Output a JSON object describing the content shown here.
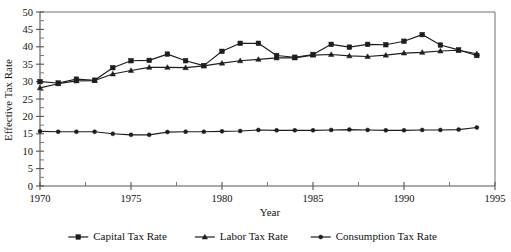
{
  "chart_data": {
    "type": "line",
    "title": "",
    "xlabel": "Year",
    "ylabel": "Effective Tax Rate",
    "xlim": [
      1970,
      1995
    ],
    "ylim": [
      0,
      50
    ],
    "ytick_step": 5,
    "xtick_step": 5,
    "x_minor_step": 2.5,
    "grid": false,
    "legend_position": "bottom",
    "x": [
      1970,
      1971,
      1972,
      1973,
      1974,
      1975,
      1976,
      1977,
      1978,
      1979,
      1980,
      1981,
      1982,
      1983,
      1984,
      1985,
      1986,
      1987,
      1988,
      1989,
      1990,
      1991,
      1992,
      1993,
      1994
    ],
    "xticklabels": [
      "1970",
      "1975",
      "1980",
      "1985",
      "1990",
      "1995"
    ],
    "xtickvalues": [
      1970,
      1975,
      1980,
      1985,
      1990,
      1995
    ],
    "yticklabels": [
      "0",
      "5",
      "10",
      "15",
      "20",
      "25",
      "30",
      "35",
      "40",
      "45",
      "50"
    ],
    "ytickvalues": [
      0,
      5,
      10,
      15,
      20,
      25,
      30,
      35,
      40,
      45,
      50
    ],
    "series": [
      {
        "name": "Capital Tax Rate",
        "marker": "square",
        "color": "#1d1d1d",
        "values": [
          30.0,
          29.6,
          30.7,
          30.4,
          34.0,
          36.0,
          36.1,
          37.9,
          36.0,
          34.6,
          38.7,
          41.0,
          41.0,
          37.5,
          37.0,
          37.8,
          40.7,
          39.9,
          40.7,
          40.6,
          41.6,
          43.5,
          40.5,
          39.1,
          37.5
        ]
      },
      {
        "name": "Labor Tax Rate",
        "marker": "triangle",
        "color": "#1d1d1d",
        "values": [
          28.2,
          29.4,
          30.2,
          30.3,
          32.2,
          33.2,
          34.1,
          34.1,
          34.0,
          34.5,
          35.3,
          36.0,
          36.4,
          36.8,
          36.8,
          37.6,
          37.8,
          37.4,
          37.2,
          37.6,
          38.2,
          38.4,
          38.8,
          39.0,
          38.0
        ]
      },
      {
        "name": "Consumption Tax Rate",
        "marker": "circle",
        "color": "#1d1d1d",
        "values": [
          15.7,
          15.6,
          15.6,
          15.6,
          15.0,
          14.7,
          14.7,
          15.5,
          15.6,
          15.6,
          15.7,
          15.8,
          16.1,
          16.0,
          16.0,
          16.0,
          16.1,
          16.2,
          16.1,
          16.0,
          16.0,
          16.1,
          16.1,
          16.2,
          16.8
        ]
      }
    ]
  },
  "legend": {
    "entries": [
      {
        "label": "Capital Tax Rate"
      },
      {
        "label": "Labor Tax Rate"
      },
      {
        "label": "Consumption Tax Rate"
      }
    ]
  },
  "axes": {
    "x_title": "Year",
    "y_title": "Effective Tax Rate"
  }
}
